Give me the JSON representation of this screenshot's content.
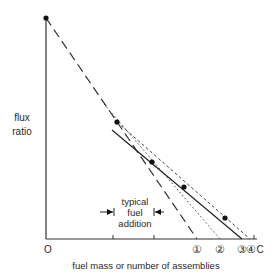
{
  "diagram": {
    "y_label_line1": "flux",
    "y_label_line2": "ratio",
    "x_label": "fuel mass or number of assemblies",
    "origin_label": "O",
    "annotation": {
      "line1": "typical",
      "line2": "fuel",
      "line3": "addition"
    },
    "intercept_labels": [
      "①",
      "②",
      "③",
      "④"
    ],
    "critical_label": "C",
    "colors": {
      "ink": "#222222",
      "background": "#ffffff"
    }
  }
}
